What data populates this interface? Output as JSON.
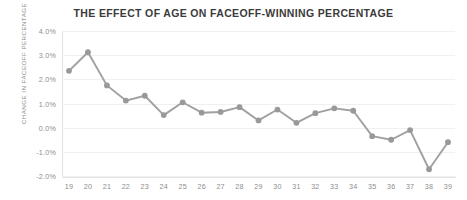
{
  "chart_data": {
    "type": "line",
    "title": "THE EFFECT OF AGE ON FACEOFF-WINNING PERCENTAGE",
    "xlabel": "",
    "ylabel": "CHANGE IN FACEOFF PERCENTAGE",
    "categories": [
      "19",
      "20",
      "21",
      "22",
      "23",
      "24",
      "25",
      "26",
      "27",
      "28",
      "29",
      "30",
      "31",
      "32",
      "33",
      "34",
      "35",
      "36",
      "37",
      "38",
      "39"
    ],
    "values": [
      2.35,
      3.12,
      1.75,
      1.12,
      1.32,
      0.52,
      1.05,
      0.62,
      0.65,
      0.85,
      0.3,
      0.75,
      0.2,
      0.6,
      0.8,
      0.7,
      -0.35,
      -0.5,
      -0.1,
      -1.72,
      -0.6
    ],
    "series": [
      {
        "name": "Change in faceoff percentage",
        "values": [
          2.35,
          3.12,
          1.75,
          1.12,
          1.32,
          0.52,
          1.05,
          0.62,
          0.65,
          0.85,
          0.3,
          0.75,
          0.2,
          0.6,
          0.8,
          0.7,
          -0.35,
          -0.5,
          -0.1,
          -1.72,
          -0.6
        ]
      }
    ],
    "ytick_labels": [
      "4.0%",
      "3.0%",
      "2.0%",
      "1.0%",
      "0.0%",
      "-1.0%",
      "-2.0%"
    ],
    "ytick_values": [
      4,
      3,
      2,
      1,
      0,
      -1,
      -2
    ],
    "ylim": [
      -2,
      4
    ],
    "grid": true,
    "legend": false,
    "colors": {
      "line": "#a0a0a0",
      "marker": "#999999",
      "grid": "#f0f0f0",
      "axis": "#e2e2e2",
      "title": "#3b3b3b",
      "tick_text": "#8d8d8d"
    }
  }
}
